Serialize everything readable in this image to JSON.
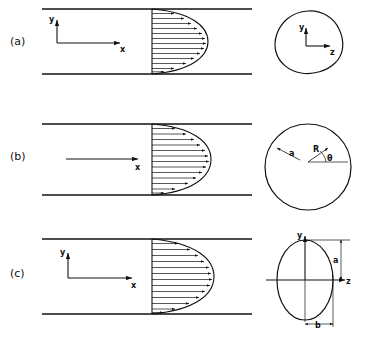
{
  "figure": {
    "background": "#ffffff",
    "ink_color": "#111111"
  },
  "panels": [
    {
      "id": "a",
      "label": "(a)",
      "side_view": {
        "axes": [
          {
            "name": "y-axis",
            "label": "y",
            "direction": "up"
          },
          {
            "name": "x-axis",
            "label": "x",
            "direction": "right"
          }
        ],
        "profile": {
          "type": "parabolic",
          "arrow_count": 13,
          "description": "fully developed parabolic velocity profile"
        },
        "walls": {
          "count": 2,
          "orientation": "horizontal"
        }
      },
      "cross_section": {
        "shape": "arbitrary",
        "description": "irregular closed blob cross section",
        "axes": [
          {
            "name": "y-axis",
            "label": "y",
            "direction": "up"
          },
          {
            "name": "z-axis",
            "label": "z",
            "direction": "right"
          }
        ],
        "dimensions": []
      }
    },
    {
      "id": "b",
      "label": "(b)",
      "side_view": {
        "axes": [
          {
            "name": "x-axis",
            "label": "x",
            "direction": "right"
          }
        ],
        "profile": {
          "type": "parabolic",
          "arrow_count": 13,
          "description": "fully developed parabolic velocity profile"
        },
        "walls": {
          "count": 2,
          "orientation": "horizontal"
        }
      },
      "cross_section": {
        "shape": "circle",
        "description": "circular pipe cross section",
        "axes": [],
        "dimensions": [
          {
            "name": "outer-radius",
            "label": "a",
            "meaning": "pipe radius"
          },
          {
            "name": "local-radius",
            "label": "R",
            "meaning": "radial coordinate"
          },
          {
            "name": "polar-angle",
            "label": "θ",
            "meaning": "angle from horizontal reference line"
          }
        ]
      }
    },
    {
      "id": "c",
      "label": "(c)",
      "side_view": {
        "axes": [
          {
            "name": "y-axis",
            "label": "y",
            "direction": "up"
          },
          {
            "name": "x-axis",
            "label": "x",
            "direction": "right"
          }
        ],
        "profile": {
          "type": "parabolic",
          "arrow_count": 13,
          "description": "fully developed blunt parabolic velocity profile"
        },
        "walls": {
          "count": 2,
          "orientation": "horizontal"
        }
      },
      "cross_section": {
        "shape": "ellipse",
        "description": "elliptical duct cross section",
        "axes": [
          {
            "name": "y-axis",
            "label": "y",
            "direction": "up"
          },
          {
            "name": "z-axis",
            "label": "z",
            "direction": "right"
          }
        ],
        "dimensions": [
          {
            "name": "semi-major-axis",
            "label": "a",
            "meaning": "vertical semi-axis"
          },
          {
            "name": "semi-minor-axis",
            "label": "b",
            "meaning": "horizontal semi-axis"
          }
        ]
      }
    }
  ]
}
